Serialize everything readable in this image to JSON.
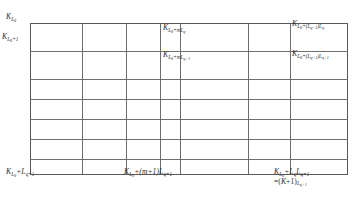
{
  "figure": {
    "type": "grid-lattice-diagram",
    "grid": {
      "columns": 7,
      "rows": 7,
      "vertical_line_x": [
        0,
        52,
        96,
        130,
        150,
        218,
        260,
        318
      ],
      "horizontal_line_y": [
        0,
        28,
        56,
        76,
        96,
        116,
        136,
        152
      ],
      "line_color": "#6e6e6e",
      "border_color": "#5a5a5a",
      "background": "#ffffff"
    },
    "labels": {
      "top_left": {
        "base": "K",
        "sub": "L",
        "subsub": "0"
      },
      "left_second": {
        "base": "K",
        "sub": "L",
        "subsub": "0",
        "sub_tail": "+1"
      },
      "mid_top": {
        "base": "K",
        "sub": "L",
        "subsub": "0",
        "sub_tail": "+mL",
        "sub_tail2": "q"
      },
      "mid_second": {
        "base": "K",
        "sub": "L",
        "subsub": "0",
        "sub_tail": "+mL",
        "sub_tail2": "q+1"
      },
      "right_top": {
        "base": "K",
        "sub": "L",
        "subsub": "0",
        "sub_tail": "+(L",
        "sub_tail2": "q−1",
        "sub_tail3": ")L",
        "sub_tail4": "q"
      },
      "right_second": {
        "base": "K",
        "sub": "L",
        "subsub": "0",
        "sub_tail": "+(L",
        "sub_tail2": "q−1",
        "sub_tail3": ")L",
        "sub_tail4": "q+1"
      },
      "bottom_left": {
        "base": "K",
        "sub": "L",
        "subsub": "0",
        "plus": "+",
        "base2": "L",
        "sub2": "q+1"
      },
      "bottom_mid": {
        "base": "K",
        "sub": "L",
        "subsub": "0",
        "mid": "+(m+1)",
        "base2": "L",
        "sub2": "q+1"
      },
      "bottom_right_line1": {
        "base": "K",
        "sub": "L",
        "subsub": "0",
        "plus": "+",
        "base2": "L",
        "sub2": "q",
        "base3": "L",
        "sub3": "q+1"
      },
      "bottom_right_line2": {
        "eq": "=(",
        "base": "K",
        "plus": "+1)",
        "sub": "L",
        "subsub": "q+1"
      }
    }
  }
}
